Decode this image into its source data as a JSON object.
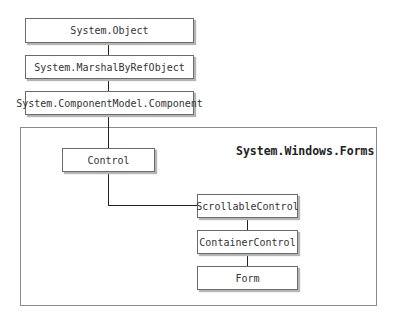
{
  "diagram": {
    "type": "class-hierarchy",
    "top_classes": [
      "System.Object",
      "System.MarshalByRefObject",
      "System.ComponentModel.Component"
    ],
    "namespace": {
      "label": "System.Windows.Forms",
      "classes": [
        "Control",
        "ScrollableControl",
        "ContainerControl",
        "Form"
      ]
    },
    "edges": [
      [
        "System.Object",
        "System.MarshalByRefObject"
      ],
      [
        "System.MarshalByRefObject",
        "System.ComponentModel.Component"
      ],
      [
        "System.ComponentModel.Component",
        "Control"
      ],
      [
        "Control",
        "ScrollableControl"
      ],
      [
        "ScrollableControl",
        "ContainerControl"
      ],
      [
        "ContainerControl",
        "Form"
      ]
    ]
  }
}
